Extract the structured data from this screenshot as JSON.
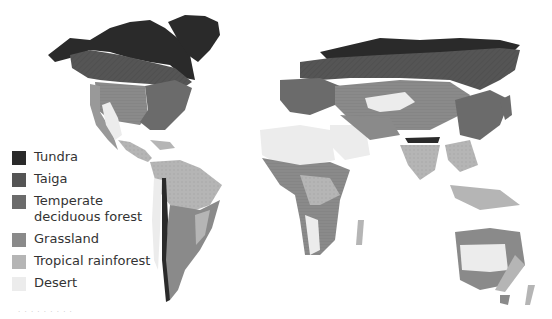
{
  "map": {
    "title": "World biomes",
    "colors": {
      "tundra": "#2a2a2a",
      "taiga": "#555555",
      "temperate": "#6b6b6b",
      "grassland": "#8a8a8a",
      "rainforest": "#b5b5b5",
      "desert": "#ececec",
      "background": "#ffffff"
    }
  },
  "legend": {
    "items": [
      {
        "key": "tundra",
        "label": "Tundra",
        "color": "#2a2a2a"
      },
      {
        "key": "taiga",
        "label": "Taiga",
        "color": "#555555"
      },
      {
        "key": "temperate",
        "label": "Temperate deciduous forest",
        "color": "#6b6b6b"
      },
      {
        "key": "grassland",
        "label": "Grassland",
        "color": "#8a8a8a"
      },
      {
        "key": "rainforest",
        "label": "Tropical rainforest",
        "color": "#b5b5b5"
      },
      {
        "key": "desert",
        "label": "Desert",
        "color": "#ececec"
      }
    ]
  },
  "caption": "·  ·  ·  ·  ·  ·  ·  ·  ·"
}
